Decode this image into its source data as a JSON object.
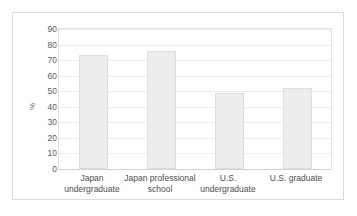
{
  "chart_data": {
    "type": "bar",
    "title": "",
    "subtitle": "",
    "xlabel": "",
    "ylabel": "%",
    "categories": [
      "Japan\nundergraduate",
      "Japan professional\nschool",
      "U.S.\nundergraduate",
      "U.S. graduate"
    ],
    "values": [
      73,
      76,
      49,
      52
    ],
    "ylim": [
      0,
      90
    ],
    "ytick_labels": [
      "0",
      "10",
      "20",
      "30",
      "40",
      "50",
      "60",
      "70",
      "80",
      "90"
    ],
    "ytick_values": [
      0,
      10,
      20,
      30,
      40,
      50,
      60,
      70,
      80,
      90
    ],
    "grid": true,
    "legend": false,
    "legend_position": "none",
    "series": [
      {
        "name": "",
        "values": [
          73,
          76,
          49,
          52
        ]
      }
    ],
    "colors": {
      "bar_fill": "#eceded",
      "bar_border": "#dedede",
      "gridline": "#ededed",
      "axis": "#d2d2d2",
      "tick_text": "#595959",
      "label_text": "#4d4d4d",
      "frame": "#dcdcdc"
    }
  }
}
